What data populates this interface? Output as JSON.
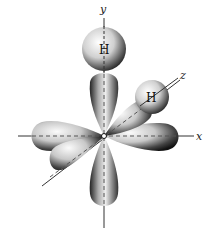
{
  "diagram": {
    "type": "sp3 orbital / molecular geometry",
    "axes": {
      "x_label": "x",
      "y_label": "y",
      "z_label": "z"
    },
    "atoms": [
      {
        "label": "H",
        "position": "top along y-axis"
      },
      {
        "label": "H",
        "position": "along z-axis"
      }
    ],
    "lobes": [
      "+y (upper)",
      "-y (lower)",
      "+x (right)",
      "-x (left)",
      "+z (toward H)",
      "-z (front-left)"
    ],
    "colors": {
      "lobe_light": "#f2f2f2",
      "lobe_dark": "#1a1a1a",
      "axis_line": "#333333",
      "background": "#ffffff"
    }
  }
}
